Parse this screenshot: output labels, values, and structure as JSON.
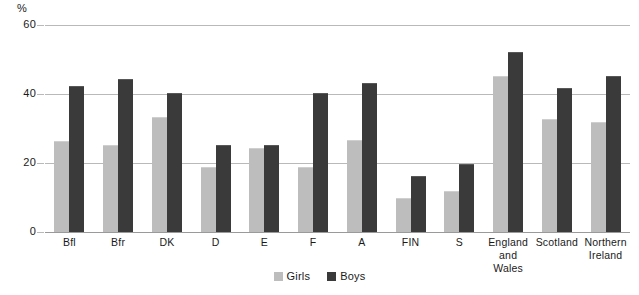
{
  "chart_data": {
    "type": "bar",
    "title": "",
    "subtitle": "",
    "xlabel": "",
    "ylabel": "%",
    "unit_label": "%",
    "ylim": [
      0,
      60
    ],
    "ytick_values": [
      0,
      20,
      40,
      60
    ],
    "ytick_labels": [
      "0",
      "20",
      "40",
      "60"
    ],
    "grid": true,
    "grid_axis": "y",
    "legend_position": "bottom-center",
    "categories": [
      "Bfl",
      "Bfr",
      "DK",
      "D",
      "E",
      "F",
      "A",
      "FIN",
      "S",
      "England\nand\nWales",
      "Scotland",
      "Northern\nIreland"
    ],
    "series": [
      {
        "name": "Girls",
        "color": "#bdbdbd",
        "values": [
          26,
          25,
          33,
          18.5,
          24,
          18.5,
          26.5,
          9.5,
          11.5,
          45,
          32.5,
          31.5
        ]
      },
      {
        "name": "Boys",
        "color": "#3a3a3a",
        "values": [
          42,
          44,
          40,
          25,
          25,
          40,
          43,
          16,
          19.5,
          52,
          41.5,
          45
        ]
      }
    ]
  },
  "legend": {
    "items": [
      {
        "label": "Girls",
        "swatch": "girls-swatch"
      },
      {
        "label": "Boys",
        "swatch": "boys-swatch"
      }
    ]
  }
}
